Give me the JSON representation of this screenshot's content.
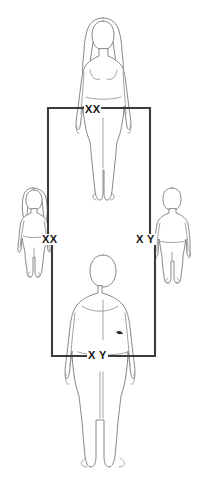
{
  "diagram": {
    "type": "sex-chromosome-inheritance-pedigree",
    "title": "",
    "colors": {
      "background": "#ffffff",
      "figure_outline": "#7a7a7a",
      "connector_line": "#3c3c3c",
      "label_text": "#151515"
    },
    "parents": [
      {
        "id": "mother",
        "role": "mother",
        "sex": "female",
        "figure": "adult-female-long-hair",
        "position": "top-center",
        "karyotype": "XX"
      },
      {
        "id": "father",
        "role": "father",
        "sex": "male",
        "figure": "adult-male",
        "position": "bottom-center",
        "karyotype": "X Y"
      }
    ],
    "children": [
      {
        "id": "daughter",
        "role": "daughter",
        "sex": "female",
        "figure": "child-female",
        "position": "middle-left",
        "karyotype": "XX"
      },
      {
        "id": "son",
        "role": "son",
        "sex": "male",
        "figure": "child-male",
        "position": "middle-right",
        "karyotype": "X Y"
      }
    ],
    "connectors": [
      {
        "id": "mother-to-children",
        "from": "mother",
        "to": [
          "daughter",
          "son"
        ],
        "shape": "downward-bracket"
      },
      {
        "id": "father-to-children",
        "from": "father",
        "to": [
          "daughter",
          "son"
        ],
        "shape": "upward-bracket"
      }
    ]
  }
}
